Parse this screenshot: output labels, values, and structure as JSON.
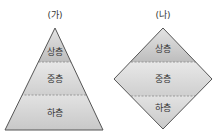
{
  "diagrams": [
    {
      "caption": "(가)",
      "shape": "pyramid",
      "layers": [
        "상층",
        "중층",
        "하층"
      ]
    },
    {
      "caption": "(나)",
      "shape": "diamond",
      "layers": [
        "상층",
        "중층",
        "하층"
      ]
    }
  ],
  "colors": {
    "top_fill": "#c9c9c9",
    "mid_fill": "#dcdcdc",
    "bottom_fill": "#d2d2d2",
    "outline": "#555555",
    "divider": "#888888"
  }
}
